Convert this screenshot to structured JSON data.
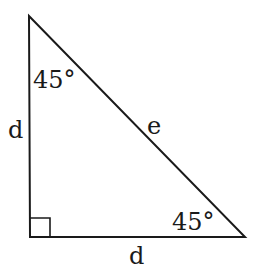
{
  "diagram": {
    "type": "right-isosceles-triangle",
    "stroke_color": "#1a1a1a",
    "vertices": {
      "top": [
        29,
        16
      ],
      "bottom_left": [
        30,
        237
      ],
      "bottom_right": [
        245,
        237
      ]
    },
    "right_angle_marker": "bottom_left",
    "labels": {
      "left_side": "d",
      "bottom_side": "d",
      "hypotenuse": "e",
      "top_angle": "45°",
      "bottom_right_angle": "45°"
    }
  }
}
